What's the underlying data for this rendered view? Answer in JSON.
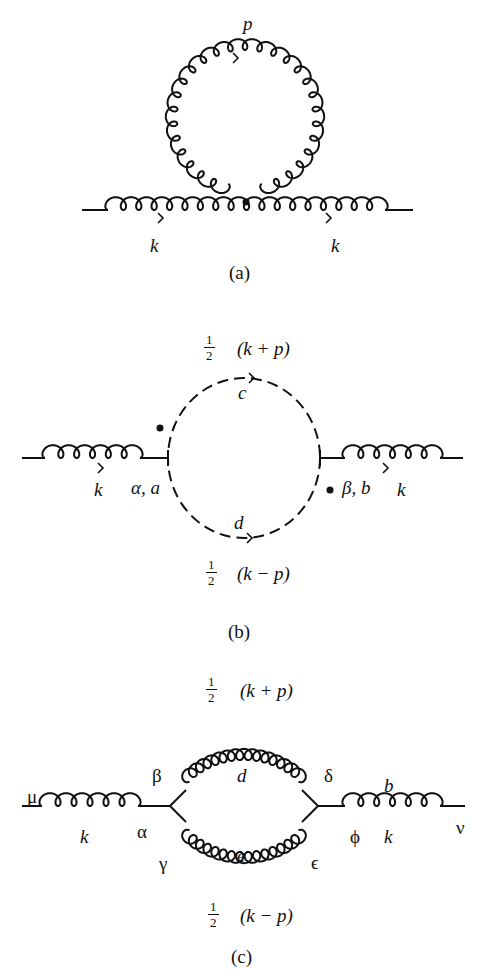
{
  "figure": {
    "panels": [
      {
        "id": "a",
        "caption": "(a)",
        "description": "Gluon tadpole self-energy: gluon loop attached at a four-gluon vertex on a gluon line",
        "labels": {
          "loop_momentum": "p",
          "in_momentum": "k",
          "out_momentum": "k"
        }
      },
      {
        "id": "b",
        "caption": "(b)",
        "description": "Ghost loop contribution to gluon self-energy",
        "labels": {
          "top_fraction_num": "1",
          "top_fraction_den": "2",
          "top_expr": "(k + p)",
          "top_line": "c",
          "bottom_line": "d",
          "bottom_fraction_num": "1",
          "bottom_fraction_den": "2",
          "bottom_expr": "(k − p)",
          "in_momentum": "k",
          "left_vertex": "α, a",
          "right_vertex": "β, b",
          "out_momentum": "k"
        }
      },
      {
        "id": "c",
        "caption": "(c)",
        "description": "Gluon loop contribution with two three-gluon vertices",
        "labels": {
          "top_fraction_num": "1",
          "top_fraction_den": "2",
          "top_expr": "(k + p)",
          "bottom_fraction_num": "1",
          "bottom_fraction_den": "2",
          "bottom_expr": "(k − p)",
          "mu": "μ",
          "nu": "ν",
          "left_momentum": "k",
          "right_momentum": "k",
          "alpha": "α",
          "beta": "β",
          "gamma": "γ",
          "delta": "δ",
          "epsilon": "ϵ",
          "phi": "ϕ",
          "top_line": "d",
          "bottom_line": "e",
          "right_color": "b"
        }
      }
    ]
  }
}
